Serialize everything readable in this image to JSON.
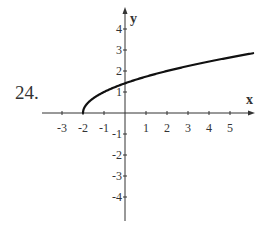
{
  "problem_number": "24.",
  "chart_data": {
    "type": "line",
    "title": "",
    "function": "y = sqrt(x + 2)",
    "xlabel": "x",
    "ylabel": "y",
    "xlim": [
      -4,
      6
    ],
    "ylim": [
      -5,
      5
    ],
    "grid": false,
    "x_ticks": [
      -3,
      -2,
      -1,
      1,
      2,
      3,
      4,
      5
    ],
    "x_tick_labels": [
      "-3",
      "-2",
      "-1",
      "1",
      "2",
      "3",
      "4",
      "5"
    ],
    "y_ticks": [
      -4,
      -3,
      -2,
      -1,
      1,
      2,
      3,
      4
    ],
    "y_tick_labels": [
      "-4",
      "-3",
      "-2",
      "-1",
      "1",
      "2",
      "3",
      "4"
    ],
    "series": [
      {
        "name": "sqrt(x+2)",
        "x": [
          -2,
          -1.9,
          -1.75,
          -1.5,
          -1,
          -0.5,
          0,
          1,
          2,
          3,
          4,
          5,
          6
        ],
        "y": [
          0,
          0.32,
          0.5,
          0.71,
          1,
          1.22,
          1.41,
          1.73,
          2,
          2.24,
          2.45,
          2.65,
          2.83
        ]
      }
    ],
    "colors": {
      "axis": "#333333",
      "curve": "#111111",
      "text": "#333333"
    }
  }
}
